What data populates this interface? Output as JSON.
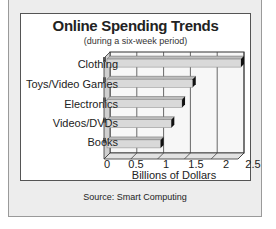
{
  "chart_data": {
    "type": "bar",
    "orientation": "horizontal",
    "title": "Online Spending Trends",
    "subtitle": "(during a six-week period)",
    "categories": [
      "Clothing",
      "Toys/Video Games",
      "Electronics",
      "Videos/DVDs",
      "Books"
    ],
    "values": [
      2.5,
      1.6,
      1.4,
      1.2,
      1.0
    ],
    "xlabel": "Billions of Dollars",
    "ylabel": "",
    "xlim": [
      0,
      2.5
    ],
    "xticks": [
      "0",
      "0.5",
      "1",
      "1.5",
      "2",
      "2.5"
    ],
    "grid": true,
    "legend": null,
    "source": "Source: Smart Computing"
  },
  "colors": {
    "bar_face": "#d9d9d9",
    "bar_top": "#bdbdbd",
    "bar_end": "#111111",
    "frame_bg": "#ededed",
    "plot_wall": "#f7f7f7"
  }
}
